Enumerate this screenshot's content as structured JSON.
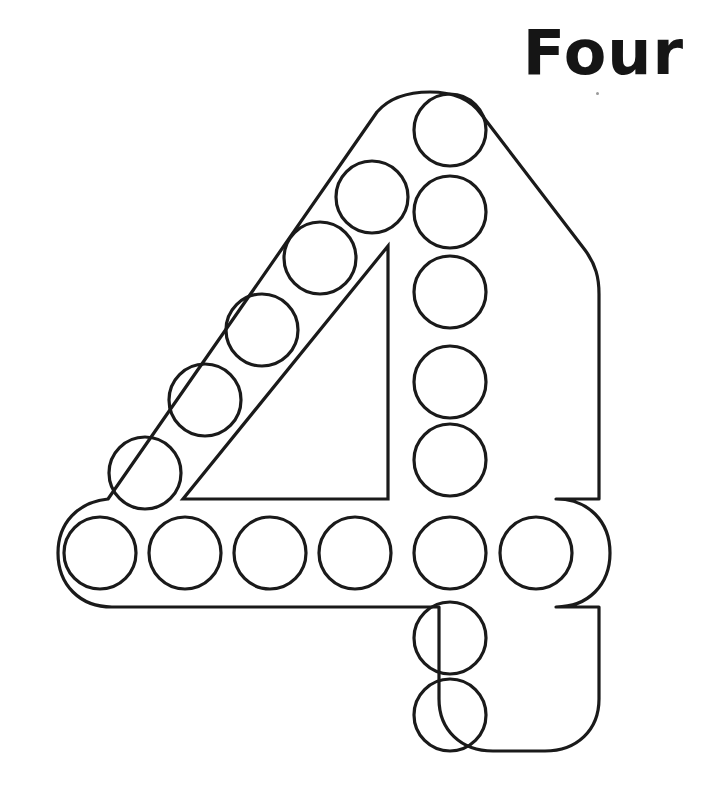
{
  "worksheet": {
    "title_word": "Four",
    "numeral": "4",
    "theme": "do-a-dot number tracing worksheet",
    "ink_color": "#1a1a1a",
    "page_background": "#ffffff",
    "stroke_width": 3,
    "dot_count": 19,
    "canvas": {
      "width": 718,
      "height": 810
    }
  },
  "numeral_outline": {
    "name": "numeral-four-outline",
    "path": "M 430 90 C 455 90 480 100 492 118 L 584 238 C 596 256 600 276 600 296 L 600 500 L 560 500 C 590 500 612 520 612 553 C 612 586 590 606 560 606 L 600 606 L 600 700 C 600 730 578 752 545 752 L 492 752 C 459 752 437 730 437 700 L 437 606 L 110 606 C 80 606 58 586 58 553 C 58 522 78 502 108 500 L 380 108 C 392 96 410 90 430 90 Z",
    "description": "Outer contour of the numeral four with rounded stroke terminals"
  },
  "circles": {
    "diagonal_stroke": [
      {
        "cx": 320,
        "cy": 258,
        "r": 36
      },
      {
        "cx": 262,
        "cy": 330,
        "r": 36
      },
      {
        "cx": 205,
        "cy": 400,
        "r": 36
      },
      {
        "cx": 145,
        "cy": 473,
        "r": 36
      }
    ],
    "vertical_stroke": [
      {
        "cx": 450,
        "cy": 130,
        "r": 36
      },
      {
        "cx": 450,
        "cy": 212,
        "r": 36
      },
      {
        "cx": 450,
        "cy": 292,
        "r": 36
      },
      {
        "cx": 450,
        "cy": 382,
        "r": 36
      },
      {
        "cx": 450,
        "cy": 460,
        "r": 36
      },
      {
        "cx": 450,
        "cy": 553,
        "r": 36
      },
      {
        "cx": 450,
        "cy": 638,
        "r": 36
      },
      {
        "cx": 450,
        "cy": 715,
        "r": 36
      }
    ],
    "horizontal_bar": [
      {
        "cx": 100,
        "cy": 553,
        "r": 36
      },
      {
        "cx": 185,
        "cy": 553,
        "r": 36
      },
      {
        "cx": 270,
        "cy": 553,
        "r": 36
      },
      {
        "cx": 355,
        "cy": 553,
        "r": 36
      },
      {
        "cx": 536,
        "cy": 553,
        "r": 36
      }
    ],
    "upper_diagonal": [
      {
        "cx": 372,
        "cy": 197,
        "r": 36
      },
      {
        "cx": 148,
        "cy": 473,
        "r": 0
      }
    ]
  },
  "inner_triangle": {
    "name": "counter-triangle",
    "path": "M 388 246 L 388 500 L 182 500 Z",
    "description": "Inner negative-space triangle of the numeral four"
  },
  "scan_artifacts": [
    {
      "x": 596,
      "y": 92
    }
  ]
}
